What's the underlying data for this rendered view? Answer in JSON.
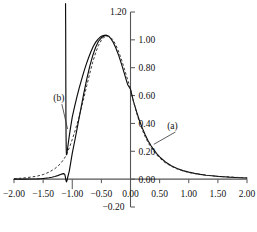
{
  "chart_data": {
    "type": "line",
    "title": "",
    "subtitle": "",
    "xlabel": "",
    "ylabel": "",
    "xlim": [
      -2.0,
      2.0
    ],
    "ylim": [
      -0.2,
      1.2
    ],
    "grid": false,
    "legend_position": "inline-annotations",
    "xticks": [
      -2.0,
      -1.5,
      -1.0,
      -0.5,
      0.0,
      0.5,
      1.0,
      1.5,
      2.0
    ],
    "xtick_labels": [
      "-2.00",
      "-1.50",
      "-1.00",
      "-0.50",
      "0.00",
      "0.50",
      "1.00",
      "1.50",
      "2.00"
    ],
    "yticks": [
      -0.2,
      0.0,
      0.2,
      0.4,
      0.6,
      0.8,
      1.0,
      1.2
    ],
    "ytick_labels": [
      "-0.20",
      "0.00",
      "0.20",
      "0.40",
      "0.60",
      "0.80",
      "1.00",
      "1.20"
    ],
    "annotations": [
      {
        "text": "(a)",
        "x": 0.72,
        "y": 0.36,
        "points_to_x": 0.4,
        "points_to_y": 0.25
      },
      {
        "text": "(b)",
        "x": -1.23,
        "y": 0.56,
        "points_to_x": -1.08,
        "points_to_y": 0.36
      }
    ],
    "series": [
      {
        "name": "(a) solid",
        "style": "solid",
        "x": [
          -2.0,
          -1.9,
          -1.8,
          -1.7,
          -1.6,
          -1.55,
          -1.5,
          -1.45,
          -1.4,
          -1.35,
          -1.3,
          -1.25,
          -1.2,
          -1.17,
          -1.15,
          -1.13,
          -1.12,
          -1.11,
          -1.1,
          -1.09,
          -1.08,
          -1.05,
          -1.0,
          -0.95,
          -0.9,
          -0.85,
          -0.8,
          -0.75,
          -0.7,
          -0.65,
          -0.6,
          -0.55,
          -0.5,
          -0.45,
          -0.42,
          -0.4,
          -0.37,
          -0.35,
          -0.3,
          -0.25,
          -0.2,
          -0.15,
          -0.1,
          -0.05,
          0.0,
          0.05,
          0.1,
          0.15,
          0.2,
          0.25,
          0.3,
          0.35,
          0.4,
          0.45,
          0.5,
          0.6,
          0.7,
          0.8,
          0.9,
          1.0,
          1.1,
          1.2,
          1.3,
          1.4,
          1.5,
          1.6,
          1.7,
          1.8,
          1.9,
          2.0
        ],
        "y": [
          0.0,
          0.0,
          0.0,
          0.001,
          0.002,
          0.003,
          0.005,
          0.007,
          0.01,
          0.014,
          0.019,
          0.025,
          0.033,
          0.038,
          0.04,
          0.035,
          0.02,
          -0.005,
          -0.02,
          -0.01,
          0.01,
          0.06,
          0.185,
          0.29,
          0.4,
          0.51,
          0.62,
          0.72,
          0.81,
          0.885,
          0.945,
          0.99,
          1.015,
          1.03,
          1.032,
          1.03,
          1.025,
          1.015,
          0.985,
          0.94,
          0.885,
          0.82,
          0.75,
          0.68,
          0.645,
          0.56,
          0.49,
          0.425,
          0.37,
          0.32,
          0.278,
          0.242,
          0.21,
          0.184,
          0.16,
          0.123,
          0.096,
          0.076,
          0.061,
          0.05,
          0.041,
          0.034,
          0.028,
          0.024,
          0.02,
          0.017,
          0.014,
          0.012,
          0.01,
          0.008
        ]
      },
      {
        "name": "(a) dashed",
        "style": "dashed",
        "x": [
          -2.0,
          -1.9,
          -1.8,
          -1.7,
          -1.6,
          -1.5,
          -1.4,
          -1.3,
          -1.25,
          -1.2,
          -1.15,
          -1.12,
          -1.1,
          -1.05,
          -1.0,
          -0.95,
          -0.9,
          -0.85,
          -0.8,
          -0.75,
          -0.7,
          -0.65,
          -0.6,
          -0.55,
          -0.5,
          -0.45,
          -0.4,
          -0.35,
          -0.3,
          -0.25,
          -0.2,
          -0.15,
          -0.1,
          -0.05,
          0.0,
          0.05,
          0.1,
          0.15,
          0.2,
          0.25,
          0.3,
          0.35,
          0.4,
          0.45,
          0.5,
          0.6,
          0.7,
          0.8,
          0.9,
          1.0,
          1.1,
          1.2,
          1.3,
          1.4,
          1.5,
          1.6,
          1.7,
          1.8,
          1.9,
          2.0
        ],
        "y": [
          0.004,
          0.006,
          0.01,
          0.015,
          0.022,
          0.033,
          0.05,
          0.075,
          0.092,
          0.112,
          0.14,
          0.16,
          0.178,
          0.225,
          0.285,
          0.35,
          0.42,
          0.5,
          0.585,
          0.672,
          0.758,
          0.838,
          0.905,
          0.96,
          0.998,
          1.02,
          1.028,
          1.022,
          1.0,
          0.962,
          0.912,
          0.852,
          0.785,
          0.715,
          0.648,
          0.56,
          0.482,
          0.414,
          0.356,
          0.306,
          0.264,
          0.229,
          0.199,
          0.174,
          0.152,
          0.117,
          0.092,
          0.073,
          0.059,
          0.048,
          0.04,
          0.033,
          0.028,
          0.024,
          0.02,
          0.017,
          0.015,
          0.013,
          0.011,
          0.009
        ]
      },
      {
        "name": "(b) left branch",
        "style": "solid",
        "x": [
          -1.115,
          -1.113,
          -1.112,
          -1.111,
          -1.11,
          -1.109,
          -1.108,
          -1.106,
          -1.104,
          -1.102,
          -1.1,
          -1.098,
          -1.096,
          -1.094
        ],
        "y": [
          1.26,
          1.1,
          0.95,
          0.8,
          0.64,
          0.5,
          0.4,
          0.3,
          0.235,
          0.2,
          0.182,
          0.175,
          0.176,
          0.182
        ]
      },
      {
        "name": "(b) right branch",
        "style": "solid",
        "x": [
          -1.094,
          -1.09,
          -1.085,
          -1.08,
          -1.07,
          -1.06,
          -1.05,
          -1.03,
          -1.0,
          -0.96,
          -0.92,
          -0.88,
          -0.84,
          -0.8,
          -0.76,
          -0.72,
          -0.68,
          -0.64,
          -0.6,
          -0.56,
          -0.52,
          -0.48,
          -0.45,
          -0.42,
          -0.4
        ],
        "y": [
          0.182,
          0.192,
          0.206,
          0.222,
          0.252,
          0.283,
          0.312,
          0.368,
          0.445,
          0.52,
          0.59,
          0.655,
          0.715,
          0.772,
          0.824,
          0.872,
          0.915,
          0.952,
          0.982,
          1.004,
          1.02,
          1.029,
          1.032,
          1.032,
          1.03
        ]
      }
    ]
  }
}
